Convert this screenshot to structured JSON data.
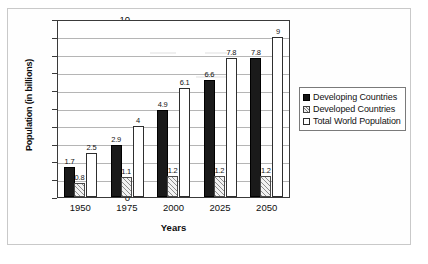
{
  "chart_data": {
    "type": "bar",
    "title": "",
    "xlabel": "Years",
    "ylabel": "Population (in billions)",
    "categories": [
      "1950",
      "1975",
      "2000",
      "2025",
      "2050"
    ],
    "ylim": [
      0,
      10
    ],
    "yticks": [
      "0",
      "1",
      "2",
      "3",
      "4",
      "5",
      "6",
      "7",
      "8",
      "9",
      "10"
    ],
    "grid": true,
    "legend_position": "right",
    "series": [
      {
        "name": "Developing Countries",
        "style": "solid-black",
        "values": [
          1.7,
          2.9,
          4.9,
          6.6,
          7.8
        ],
        "labels": [
          "1.7",
          "2.9",
          "4.9",
          "6.6",
          "7.8"
        ]
      },
      {
        "name": "Developed Countries",
        "style": "hatched",
        "values": [
          0.8,
          1.1,
          1.2,
          1.2,
          1.2
        ],
        "labels": [
          "0.8",
          "1.1",
          "1.2",
          "1.2",
          "1.2"
        ]
      },
      {
        "name": "Total World Population",
        "style": "white-outline",
        "values": [
          2.5,
          4,
          6.1,
          7.8,
          9
        ],
        "labels": [
          "2.5",
          "4",
          "6.1",
          "7.8",
          "9"
        ]
      }
    ]
  },
  "legend": {
    "items": [
      {
        "label": "Developing Countries"
      },
      {
        "label": "Developed Countries"
      },
      {
        "label": "Total World Population"
      }
    ]
  },
  "colors": {
    "developing": "#1a1a1a",
    "developed": "#8e8e8e",
    "total": "#ffffff",
    "axis": "#3a3a3a",
    "grid": "#b5b5b5"
  }
}
